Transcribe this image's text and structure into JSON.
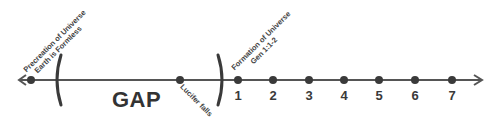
{
  "timeline": {
    "line_color": "#444444",
    "start_label": {
      "line1": "Precreation of Universe",
      "line2": "Earth is Formless"
    },
    "gap_label": "GAP",
    "lucifer_label": "Lucifer falls",
    "formation_label": {
      "line1": "Formation of Universe",
      "line2": "Gen 1:1-2"
    },
    "days": [
      "1",
      "2",
      "3",
      "4",
      "5",
      "6",
      "7"
    ]
  }
}
